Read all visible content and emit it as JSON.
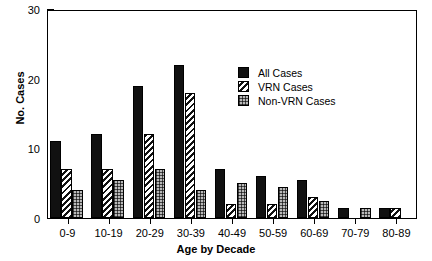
{
  "chart_data": {
    "type": "bar",
    "title": "",
    "xlabel": "Age by Decade",
    "ylabel": "No. Cases",
    "categories": [
      "0-9",
      "10-19",
      "20-29",
      "30-39",
      "40-49",
      "50-59",
      "60-69",
      "70-79",
      "80-89"
    ],
    "series": [
      {
        "name": "All Cases",
        "key": "all",
        "pattern": "solid-black",
        "values": [
          11,
          12,
          19,
          22,
          7,
          6,
          5.5,
          1.5,
          1.5
        ]
      },
      {
        "name": "VRN Cases",
        "key": "vrn",
        "pattern": "diagonal-hatch",
        "values": [
          7,
          7,
          12,
          18,
          2,
          2,
          3,
          0,
          1.5
        ]
      },
      {
        "name": "Non-VRN Cases",
        "key": "non",
        "pattern": "grey-checker",
        "values": [
          4,
          5.5,
          7,
          4,
          5,
          4.5,
          2.5,
          1.5,
          0
        ]
      }
    ],
    "ylim": [
      0,
      30
    ],
    "yticks_major": [
      0,
      10,
      20,
      30
    ],
    "yticks_minor": [
      5,
      15,
      25
    ],
    "grid": false,
    "legend_position": "inside-top-right",
    "legend_entries": [
      "All Cases",
      "VRN Cases",
      "Non-VRN Cases"
    ]
  },
  "colors": {
    "all_cases": "#111111",
    "vrn_cases": "#ffffff",
    "non_vrn_cases": "#b9b9b9",
    "axis": "#000000",
    "background": "#ffffff"
  }
}
